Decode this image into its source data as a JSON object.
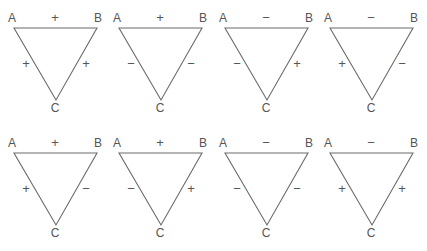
{
  "diagram": {
    "line_color": "#6b6b6b",
    "text_color": "#555555",
    "vertex_labels": {
      "a": "A",
      "b": "B",
      "c": "C"
    },
    "triangles": [
      {
        "row": 0,
        "col": 0,
        "ab": "+",
        "ac": "+",
        "bc": "+"
      },
      {
        "row": 0,
        "col": 1,
        "ab": "+",
        "ac": "−",
        "bc": "−"
      },
      {
        "row": 0,
        "col": 2,
        "ab": "−",
        "ac": "−",
        "bc": "+"
      },
      {
        "row": 0,
        "col": 3,
        "ab": "−",
        "ac": "+",
        "bc": "−"
      },
      {
        "row": 1,
        "col": 0,
        "ab": "+",
        "ac": "+",
        "bc": "−"
      },
      {
        "row": 1,
        "col": 1,
        "ab": "+",
        "ac": "−",
        "bc": "+"
      },
      {
        "row": 1,
        "col": 2,
        "ab": "−",
        "ac": "−",
        "bc": "−"
      },
      {
        "row": 1,
        "col": 3,
        "ab": "−",
        "ac": "+",
        "bc": "+"
      }
    ]
  }
}
